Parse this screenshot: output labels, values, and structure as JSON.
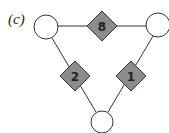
{
  "figure": {
    "panel_label": "(c)",
    "colors": {
      "edge": "#333333",
      "circle_fill": "#ffffff",
      "diamond_fill": "#8c8c8c",
      "diamond_stroke": "#333333"
    },
    "circles": [
      {
        "id": "top-left",
        "cx": 46,
        "cy": 27,
        "r": 12
      },
      {
        "id": "top-right",
        "cx": 158,
        "cy": 25,
        "r": 12
      },
      {
        "id": "bottom",
        "cx": 102,
        "cy": 122,
        "r": 11
      }
    ],
    "diamonds": [
      {
        "id": "top",
        "label": "8",
        "cx": 102,
        "cy": 26
      },
      {
        "id": "left",
        "label": "2",
        "cx": 75,
        "cy": 76
      },
      {
        "id": "right",
        "label": "1",
        "cx": 131,
        "cy": 76
      }
    ]
  }
}
